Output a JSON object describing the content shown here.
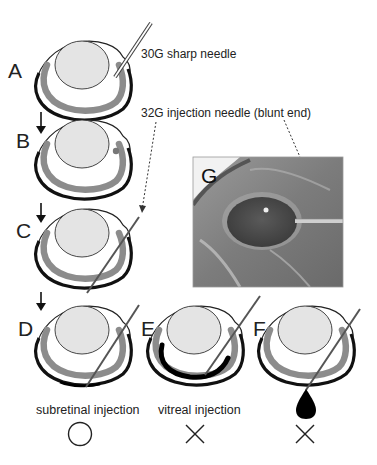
{
  "figure": {
    "panels": [
      {
        "id": "A",
        "label": "A"
      },
      {
        "id": "B",
        "label": "B"
      },
      {
        "id": "C",
        "label": "C"
      },
      {
        "id": "D",
        "label": "D"
      },
      {
        "id": "E",
        "label": "E"
      },
      {
        "id": "F",
        "label": "F"
      },
      {
        "id": "G",
        "label": "G"
      }
    ],
    "annotations": {
      "sharp_needle": "30G sharp needle",
      "injection_needle": "32G injection needle (blunt end)"
    },
    "captions": {
      "D": "subretinal injection",
      "E": "vitreal injection",
      "F": ""
    },
    "results": {
      "D": {
        "symbol": "circle",
        "meaning": "success"
      },
      "E": {
        "symbol": "cross",
        "meaning": "failure"
      },
      "F": {
        "symbol": "cross",
        "meaning": "failure"
      }
    },
    "colors": {
      "sclera": "#111111",
      "retina": "#8c8c8c",
      "lens": "#e4e4e4",
      "needle": "#666666",
      "injected_fluid": "#000000"
    }
  }
}
